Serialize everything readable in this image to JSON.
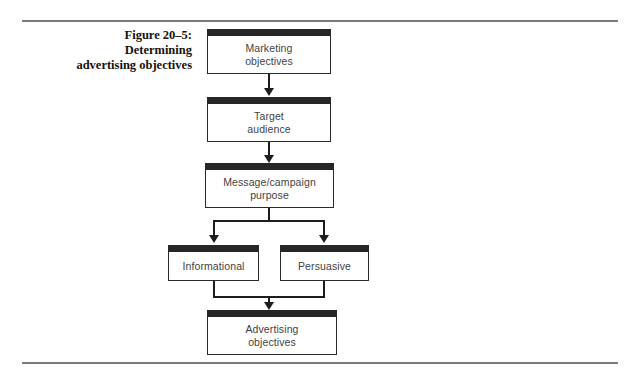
{
  "figure": {
    "caption_lines": [
      "Figure 20–5:",
      "Determining",
      "advertising objectives"
    ],
    "caption_full": "Figure 20–5: Determining advertising objectives"
  },
  "colors": {
    "background": "#ffffff",
    "rule": "#7b7b7b",
    "box_border": "#2a2a2a",
    "box_header_bar": "#262626",
    "connector": "#1d1d1d",
    "box_text": "#3f3f3f",
    "caption_text": "#16120f"
  },
  "chart_data": {
    "type": "diagram",
    "title": "Figure 20–5: Determining advertising objectives",
    "nodes": [
      {
        "id": "marketing",
        "label": "Marketing\nobjectives",
        "label_lines": [
          "Marketing",
          "objectives"
        ],
        "level": 1
      },
      {
        "id": "target",
        "label": "Target\naudience",
        "label_lines": [
          "Target",
          "audience"
        ],
        "level": 2
      },
      {
        "id": "message",
        "label": "Message/campaign\npurpose",
        "label_lines": [
          "Message/campaign",
          "purpose"
        ],
        "level": 3
      },
      {
        "id": "informational",
        "label": "Informational",
        "label_lines": [
          "Informational"
        ],
        "level": 4
      },
      {
        "id": "persuasive",
        "label": "Persuasive",
        "label_lines": [
          "Persuasive"
        ],
        "level": 4
      },
      {
        "id": "advertising",
        "label": "Advertising\nobjectives",
        "label_lines": [
          "Advertising",
          "objectives"
        ],
        "level": 5
      }
    ],
    "edges": [
      {
        "from": "marketing",
        "to": "target",
        "style": "arrow"
      },
      {
        "from": "target",
        "to": "message",
        "style": "arrow"
      },
      {
        "from": "message",
        "to": "informational",
        "style": "split-arrow"
      },
      {
        "from": "message",
        "to": "persuasive",
        "style": "split-arrow"
      },
      {
        "from": "informational",
        "to": "advertising",
        "style": "merge-arrow"
      },
      {
        "from": "persuasive",
        "to": "advertising",
        "style": "merge-arrow"
      }
    ]
  },
  "boxes": {
    "marketing": {
      "line1": "Marketing",
      "line2": "objectives"
    },
    "target": {
      "line1": "Target",
      "line2": "audience"
    },
    "message": {
      "line1": "Message/campaign",
      "line2": "purpose"
    },
    "informational": {
      "line1": "Informational"
    },
    "persuasive": {
      "line1": "Persuasive"
    },
    "advertising": {
      "line1": "Advertising",
      "line2": "objectives"
    }
  }
}
